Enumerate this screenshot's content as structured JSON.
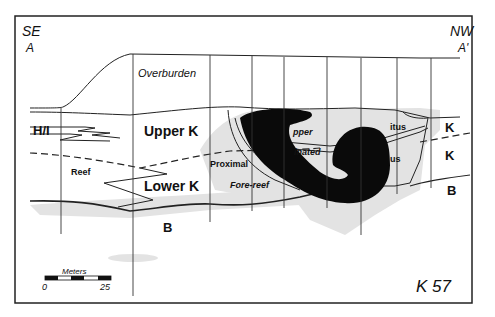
{
  "figure": {
    "id_label": "K 57",
    "orientation": {
      "left": {
        "direction": "SE",
        "point": "A"
      },
      "right": {
        "direction": "NW",
        "point": "A'"
      }
    },
    "units": {
      "overburden": "Overburden",
      "hi": "H/I",
      "upper_k": "Upper K",
      "lower_k": "Lower K",
      "reef": "Reef",
      "proximal": "Proximal",
      "fore_reef": "Fore-reef",
      "upper_partial": "pper",
      "laminated_partial": "inated",
      "detritus_partial": "itus",
      "us_partial": "us",
      "right_k_upper": "K",
      "right_k_lower": "K",
      "b_left": "B",
      "b_right": "B"
    },
    "scale_bar": {
      "title": "Meters",
      "min": "0",
      "max": "25"
    },
    "colors": {
      "line": "#222222",
      "shade": "#e2e2e2",
      "blob": "#0a0a0a",
      "background": "#ffffff"
    }
  }
}
